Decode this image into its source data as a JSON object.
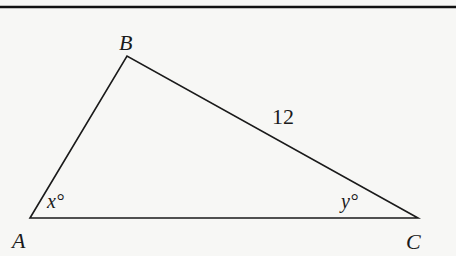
{
  "figure": {
    "type": "triangle",
    "vertices": {
      "A": {
        "label": "A",
        "x": 30,
        "y": 218
      },
      "B": {
        "label": "B",
        "x": 127,
        "y": 56
      },
      "C": {
        "label": "C",
        "x": 418,
        "y": 218
      }
    },
    "side_labels": {
      "BC": "12"
    },
    "angle_labels": {
      "A": "x°",
      "C": "y°"
    }
  }
}
